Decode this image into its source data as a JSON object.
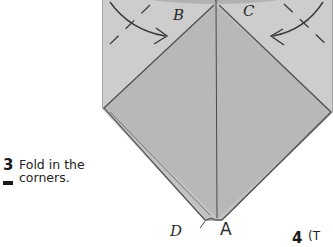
{
  "steps": [
    {
      "number": "3",
      "text_line1": "Fold in the",
      "text_line2": "corners."
    },
    {
      "number": "4",
      "text_partial": "(T"
    }
  ],
  "labels": {
    "B": "B",
    "C": "C",
    "D": "D",
    "A": "A"
  },
  "colors": {
    "paper_fill": "#c4c4c4",
    "paper_front_fill": "#b9b9b9",
    "flap_fill": "#cfcfcf",
    "fold_line": "#555555",
    "edge_line": "#6a6a6a",
    "arrow": "#3a3a3a",
    "text": "#222222"
  }
}
